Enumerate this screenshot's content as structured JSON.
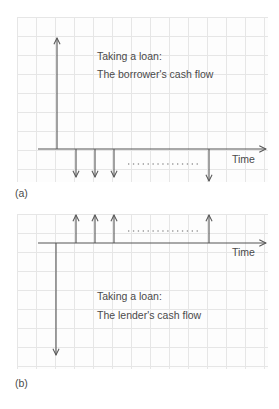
{
  "panels": [
    {
      "id": "a",
      "label": "(a)",
      "title_line1": "Taking a loan:",
      "title_line2": "The borrower's cash flow",
      "axis_label": "Time",
      "inflow": {
        "x": 57,
        "direction": "up",
        "description": "loan received"
      },
      "outflows": [
        {
          "x": 76,
          "direction": "down"
        },
        {
          "x": 95,
          "direction": "down"
        },
        {
          "x": 114,
          "direction": "down"
        },
        {
          "x": 209,
          "direction": "down"
        }
      ],
      "ellipsis": "..............."
    },
    {
      "id": "b",
      "label": "(b)",
      "title_line1": "Taking a loan:",
      "title_line2": "The lender's cash flow",
      "axis_label": "Time",
      "outflow": {
        "x": 57,
        "direction": "down",
        "description": "loan given"
      },
      "inflows": [
        {
          "x": 76,
          "direction": "up"
        },
        {
          "x": 95,
          "direction": "up"
        },
        {
          "x": 114,
          "direction": "up"
        },
        {
          "x": 209,
          "direction": "up"
        }
      ],
      "ellipsis": "..............."
    }
  ],
  "colors": {
    "line": "#555555",
    "grid": "#e6e6e6",
    "text": "#4a4a4a"
  }
}
